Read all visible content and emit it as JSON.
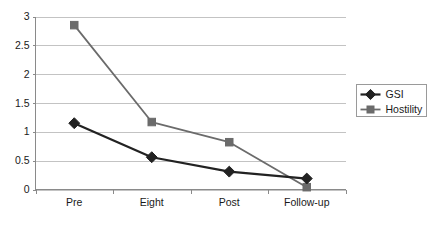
{
  "chart_data": {
    "type": "line",
    "title": "",
    "subtitle": "",
    "xlabel": "",
    "ylabel": "",
    "categories": [
      "Pre",
      "Eight",
      "Post",
      "Follow-up"
    ],
    "series": [
      {
        "name": "GSI",
        "values": [
          1.15,
          0.56,
          0.31,
          0.19
        ],
        "color": "#222222",
        "marker": "diamond"
      },
      {
        "name": "Hostility",
        "values": [
          2.85,
          1.17,
          0.82,
          0.04
        ],
        "color": "#6b6b6b",
        "marker": "square"
      }
    ],
    "ylim": [
      0,
      3
    ],
    "yticks": [
      0,
      0.5,
      1,
      1.5,
      2,
      2.5,
      3
    ],
    "ytick_labels": [
      "0",
      "0.5",
      "1",
      "1.5",
      "2",
      "2.5",
      "3"
    ],
    "grid": true,
    "grid_axis": "y",
    "legend_position": "right"
  },
  "legend": {
    "entries": [
      {
        "label": "GSI"
      },
      {
        "label": "Hostility"
      }
    ]
  },
  "colors": {
    "gsi": "#222222",
    "hostility": "#6b6b6b",
    "gridline": "#c3c3c3",
    "axis": "#8a8a8a",
    "background": "#ffffff",
    "text": "#1a1a1a"
  }
}
